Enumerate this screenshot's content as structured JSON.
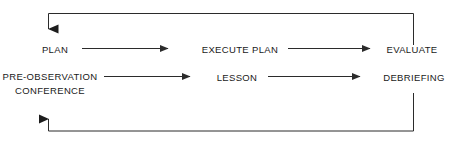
{
  "diagram": {
    "type": "cycle-flowchart",
    "background_color": "#ffffff",
    "line_color": "#2b2b2b",
    "text_color": "#1a1a1a",
    "nodes": [
      {
        "id": "plan",
        "label": "PLAN",
        "row": 1,
        "column": 1
      },
      {
        "id": "execute-plan",
        "label": "EXECUTE PLAN",
        "row": 1,
        "column": 2
      },
      {
        "id": "evaluate",
        "label": "EVALUATE",
        "row": 1,
        "column": 3
      },
      {
        "id": "pre-observation-conference",
        "label_line_1": "PRE-OBSERVATION",
        "label_line_2": "CONFERENCE",
        "row": 2,
        "column": 1
      },
      {
        "id": "lesson",
        "label": "LESSON",
        "row": 2,
        "column": 2
      },
      {
        "id": "debriefing",
        "label": "DEBRIEFING",
        "row": 2,
        "column": 3
      }
    ],
    "edges": [
      {
        "id": "plan-to-execute-plan",
        "from": "plan",
        "to": "execute-plan",
        "style": "straight-arrow"
      },
      {
        "id": "execute-plan-to-evaluate",
        "from": "execute-plan",
        "to": "evaluate",
        "style": "straight-arrow"
      },
      {
        "id": "pre-observation-conference-to-lesson",
        "from": "pre-observation-conference",
        "to": "lesson",
        "style": "straight-arrow"
      },
      {
        "id": "lesson-to-debriefing",
        "from": "lesson",
        "to": "debriefing",
        "style": "straight-arrow"
      },
      {
        "id": "evaluate-to-plan",
        "from": "evaluate",
        "to": "plan",
        "style": "elbow-arrow-top"
      },
      {
        "id": "debriefing-to-pre-observation-conference",
        "from": "debriefing",
        "to": "pre-observation-conference",
        "style": "elbow-arrow-bottom"
      }
    ]
  }
}
